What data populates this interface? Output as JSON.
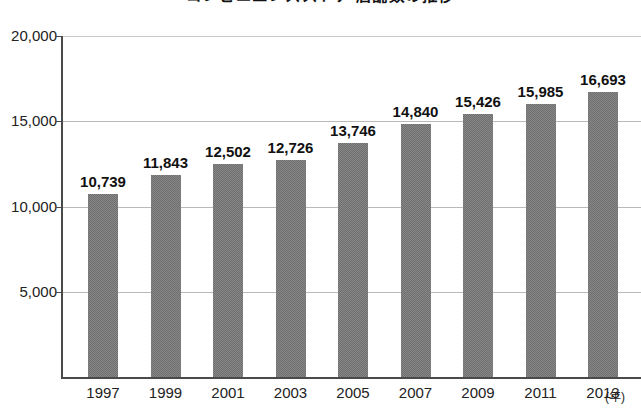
{
  "chart_data": {
    "type": "bar",
    "title": "コンビニエンスストア 店舗数の推移",
    "xlabel": "(年)",
    "ylabel": "",
    "categories": [
      "1997",
      "1999",
      "2001",
      "2003",
      "2005",
      "2007",
      "2009",
      "2011",
      "2013"
    ],
    "values": [
      10739,
      11843,
      12502,
      12726,
      13746,
      14840,
      15426,
      15985,
      16693
    ],
    "value_labels": [
      "10,739",
      "11,843",
      "12,502",
      "12,726",
      "13,746",
      "14,840",
      "15,426",
      "15,985",
      "16,693"
    ],
    "ylim": [
      0,
      20000
    ],
    "yticks": [
      5000,
      10000,
      15000,
      20000
    ],
    "ytick_labels": [
      "5,000",
      "10,000",
      "15,000",
      "20,000"
    ],
    "grid": true,
    "legend": null,
    "bar_color": "#6f6f6f",
    "gridline_color": "#b9b9b9",
    "axis_color": "#4a4a4a",
    "text_color": "#111111"
  }
}
